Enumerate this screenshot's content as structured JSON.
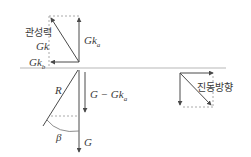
{
  "diagram": {
    "type": "force-vector-diagram",
    "labels": {
      "inertial_force_kr": "관성력",
      "gk": "Gk",
      "gk_a_base": "Gk",
      "gk_a_sub": "a",
      "gk_b_base": "Gk",
      "gk_b_sub": "b",
      "r": "R",
      "g_minus_gka_base": "G − Gk",
      "g_minus_gka_sub": "a",
      "g": "G",
      "beta": "β",
      "vibration_direction_kr": "진동방향"
    },
    "colors": {
      "line": "#4a4a4a",
      "dashed": "#9a9a9a",
      "baseline": "#b0b0b0",
      "background": "#ffffff"
    }
  }
}
